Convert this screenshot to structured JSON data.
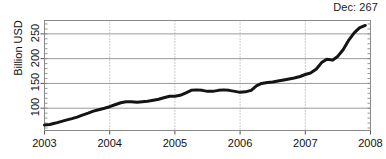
{
  "chart_data": {
    "type": "line",
    "title": "",
    "xlabel": "",
    "ylabel": "Billion USD",
    "annotation": "Dec: 267",
    "xlim": [
      2003.0,
      2008.0
    ],
    "ylim": [
      55,
      277
    ],
    "grid": "horizontal solid at y-ticks, vertical dotted at x-ticks",
    "legend": "none",
    "yticks": [
      100,
      150,
      200,
      250
    ],
    "xticks": [
      2003,
      2004,
      2005,
      2006,
      2007,
      2008
    ],
    "xtick_labels": [
      "2003",
      "2004",
      "2005",
      "2006",
      "2007",
      "2008"
    ],
    "ytick_labels": [
      "100",
      "150",
      "200",
      "250"
    ],
    "line_color": "#141414",
    "series": [
      {
        "name": "Billion USD",
        "x": [
          2003.0,
          2003.08,
          2003.17,
          2003.25,
          2003.33,
          2003.42,
          2003.5,
          2003.58,
          2003.67,
          2003.75,
          2003.83,
          2003.92,
          2004.0,
          2004.08,
          2004.17,
          2004.25,
          2004.33,
          2004.42,
          2004.5,
          2004.58,
          2004.67,
          2004.75,
          2004.83,
          2004.92,
          2005.0,
          2005.08,
          2005.17,
          2005.25,
          2005.33,
          2005.42,
          2005.5,
          2005.58,
          2005.67,
          2005.75,
          2005.83,
          2005.92,
          2006.0,
          2006.08,
          2006.17,
          2006.25,
          2006.33,
          2006.42,
          2006.5,
          2006.58,
          2006.67,
          2006.75,
          2006.83,
          2006.92,
          2007.0,
          2007.08,
          2007.17,
          2007.25,
          2007.33,
          2007.42,
          2007.5,
          2007.58,
          2007.67,
          2007.75,
          2007.83,
          2007.92
        ],
        "y": [
          66,
          67,
          70,
          73,
          76,
          79,
          82,
          86,
          90,
          94,
          97,
          100,
          103,
          107,
          111,
          113,
          113,
          112,
          113,
          114,
          116,
          118,
          121,
          124,
          124,
          126,
          131,
          136,
          137,
          136,
          134,
          134,
          136,
          137,
          136,
          134,
          132,
          133,
          136,
          145,
          150,
          152,
          153,
          155,
          157,
          159,
          161,
          164,
          168,
          171,
          179,
          192,
          199,
          197,
          205,
          218,
          238,
          252,
          262,
          267
        ]
      }
    ]
  }
}
